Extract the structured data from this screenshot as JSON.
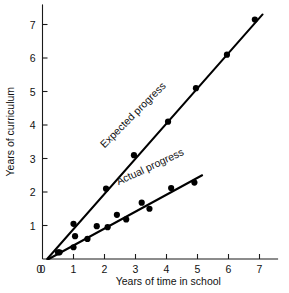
{
  "chart_data": {
    "type": "scatter",
    "title": "",
    "xlabel": "Years of time in school",
    "ylabel": "Years of curriculum",
    "xlim": [
      0,
      7.6
    ],
    "ylim": [
      0,
      7.6
    ],
    "xticks": [
      0,
      1,
      2,
      3,
      4,
      5,
      6,
      7
    ],
    "yticks": [
      0,
      1,
      2,
      3,
      4,
      5,
      6,
      7
    ],
    "xticklabels": [
      "0",
      "1",
      "2",
      "3",
      "4",
      "5",
      "6",
      "7"
    ],
    "yticklabels": [
      "0",
      "1",
      "2",
      "3",
      "4",
      "5",
      "6",
      "7"
    ],
    "grid": false,
    "legend": "inline-annotations",
    "series": [
      {
        "name": "Expected progress",
        "label": "Expected progress",
        "label_x": 2.0,
        "label_y": 3.3,
        "label_rotation": -45,
        "color": "#000000",
        "fit_line": {
          "x0": 0.15,
          "y0": 0.0,
          "x1": 7.1,
          "y1": 7.3
        },
        "points": [
          {
            "x": 0.5,
            "y": 0.2
          },
          {
            "x": 1.0,
            "y": 1.05
          },
          {
            "x": 2.05,
            "y": 2.1
          },
          {
            "x": 2.95,
            "y": 3.1
          },
          {
            "x": 4.05,
            "y": 4.1
          },
          {
            "x": 4.95,
            "y": 5.1
          },
          {
            "x": 5.95,
            "y": 6.1
          },
          {
            "x": 6.85,
            "y": 7.15
          }
        ]
      },
      {
        "name": "Actual progress",
        "label": "Actual progress",
        "label_x": 2.45,
        "label_y": 2.2,
        "label_rotation": -25,
        "color": "#000000",
        "fit_line": {
          "x0": 0.2,
          "y0": 0.0,
          "x1": 5.15,
          "y1": 2.5
        },
        "points": [
          {
            "x": 0.55,
            "y": 0.2
          },
          {
            "x": 1.0,
            "y": 0.35
          },
          {
            "x": 1.05,
            "y": 0.68
          },
          {
            "x": 1.45,
            "y": 0.6
          },
          {
            "x": 1.75,
            "y": 0.98
          },
          {
            "x": 2.1,
            "y": 0.95
          },
          {
            "x": 2.4,
            "y": 1.32
          },
          {
            "x": 2.7,
            "y": 1.18
          },
          {
            "x": 3.2,
            "y": 1.68
          },
          {
            "x": 3.45,
            "y": 1.5
          },
          {
            "x": 4.15,
            "y": 2.12
          },
          {
            "x": 4.9,
            "y": 2.28
          }
        ]
      }
    ]
  }
}
